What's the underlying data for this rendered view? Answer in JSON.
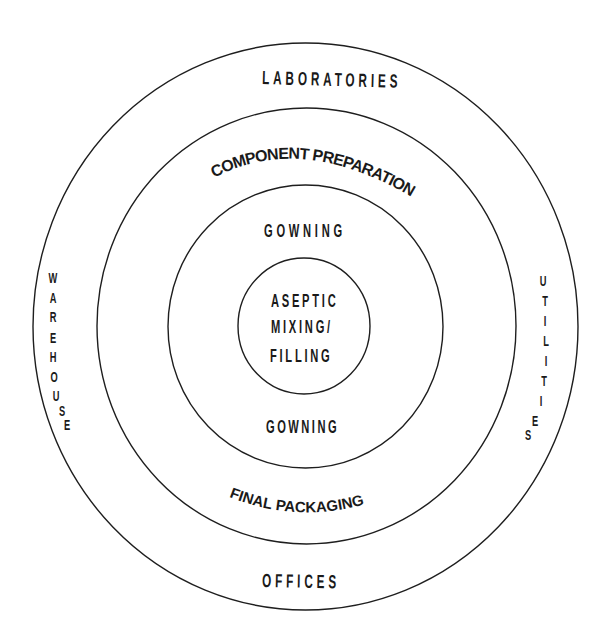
{
  "diagram": {
    "type": "concentric-zones",
    "line_color": "#1e1e1e",
    "text_color": "#1a1a1a",
    "background": "#ffffff",
    "rings": [
      {
        "name": "outer",
        "zone_top": "LABORATORIES",
        "zone_bottom": "OFFICES",
        "zone_left": "WAREHOUSE",
        "zone_right": "UTILITIES"
      },
      {
        "name": "second",
        "zone_top": "COMPONENT PREPARATION",
        "zone_bottom": "FINAL PACKAGING"
      },
      {
        "name": "third",
        "zone_top": "GOWNING",
        "zone_bottom": "GOWNING"
      },
      {
        "name": "core",
        "zone_lines": [
          "ASEPTIC",
          "MIXING/",
          "FILLING"
        ]
      }
    ]
  },
  "labels": {
    "laboratories": "LABORATORIES",
    "component_preparation": "COMPONENT PREPARATION",
    "gowning_top": "GOWNING",
    "aseptic_line1": "ASEPTIC",
    "aseptic_line2": "MIXING/",
    "aseptic_line3": "FILLING",
    "gowning_bottom": "GOWNING",
    "final_packaging": "FINAL PACKAGING",
    "offices": "OFFICES",
    "warehouse": [
      "W",
      "A",
      "R",
      "E",
      "H",
      "O",
      "U",
      "S",
      "E"
    ],
    "utilities": [
      "U",
      "T",
      "I",
      "L",
      "I",
      "T",
      "I",
      "E",
      "S"
    ]
  }
}
